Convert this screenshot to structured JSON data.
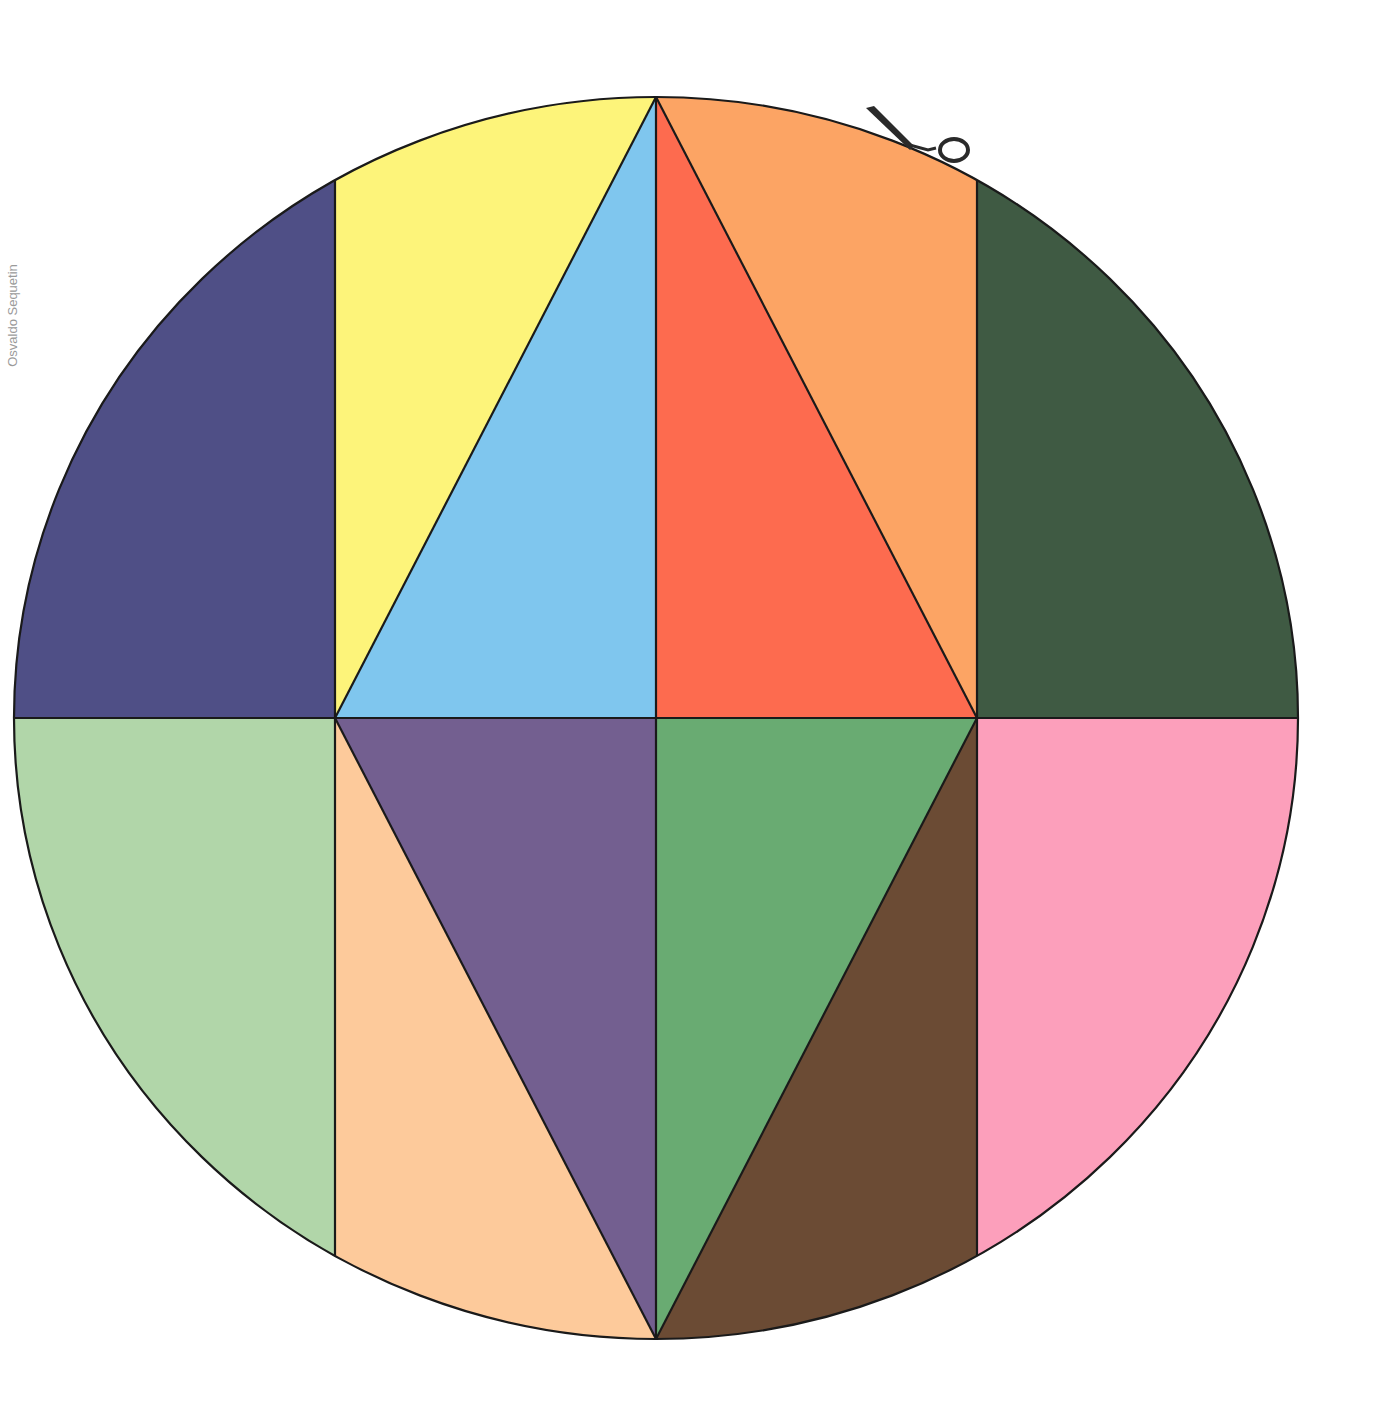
{
  "credit": {
    "text": "Osvaldo Sequetin"
  },
  "figure": {
    "title": "",
    "shape": "circle divided into colored pieces",
    "ellipse": {
      "cx": 656,
      "cy": 718,
      "rx": 642,
      "ry": 621
    },
    "outline_color": "#1a1a1a",
    "scissors_icon": "scissors-icon",
    "pieces": [
      {
        "id": "top-left-segment",
        "color": "#4f4f86"
      },
      {
        "id": "top-yellow",
        "color": "#fdf47a"
      },
      {
        "id": "top-blue-triangle",
        "color": "#7fc6ee"
      },
      {
        "id": "top-red-triangle",
        "color": "#fd6b4f"
      },
      {
        "id": "top-orange",
        "color": "#fca464"
      },
      {
        "id": "top-right-segment",
        "color": "#3f5a43"
      },
      {
        "id": "bottom-left-segment",
        "color": "#b1d6a9"
      },
      {
        "id": "bottom-peach",
        "color": "#fdca9b"
      },
      {
        "id": "bottom-purple-triangle",
        "color": "#735f90"
      },
      {
        "id": "bottom-green-triangle",
        "color": "#69ab72"
      },
      {
        "id": "bottom-brown",
        "color": "#6b4b34"
      },
      {
        "id": "bottom-right-segment",
        "color": "#fc9fbb"
      }
    ]
  }
}
